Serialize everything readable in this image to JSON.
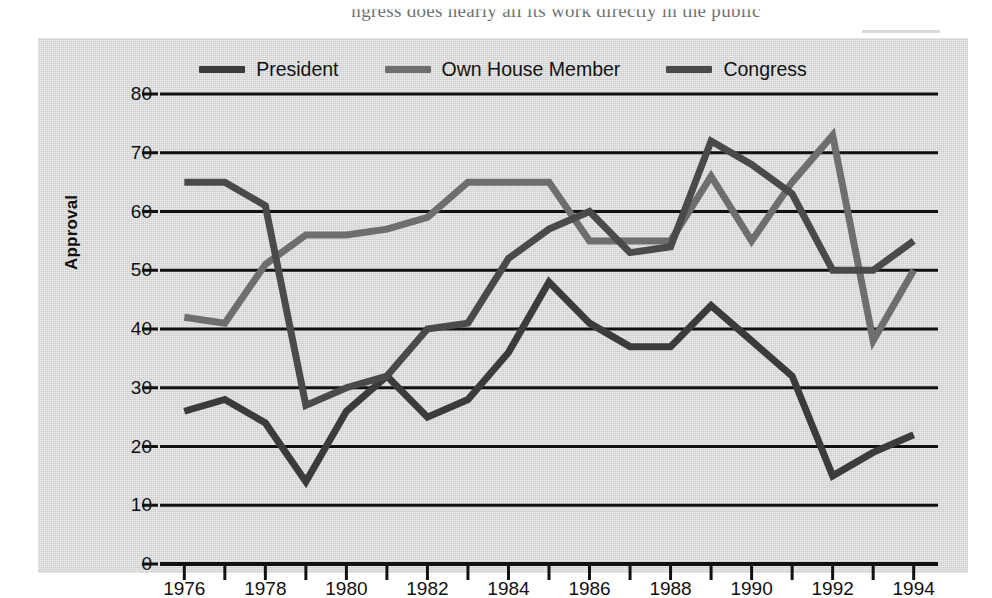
{
  "page": {
    "book_text": "ngress does nearly all its work directly in the public"
  },
  "legend": {
    "items": [
      {
        "label": "President",
        "color": "#3b3b3b"
      },
      {
        "label": "Own House Member",
        "color": "#6e6e6e"
      },
      {
        "label": "Congress",
        "color": "#4a4a4a"
      }
    ]
  },
  "axes": {
    "ylabel": "Approval",
    "yticks": [
      0,
      10,
      20,
      30,
      40,
      50,
      60,
      70,
      80
    ],
    "xticks_labeled": [
      1976,
      1978,
      1980,
      1982,
      1984,
      1986,
      1988,
      1990,
      1992,
      1994
    ],
    "xticks_all": [
      1976,
      1977,
      1978,
      1979,
      1980,
      1981,
      1982,
      1983,
      1984,
      1985,
      1986,
      1987,
      1988,
      1989,
      1990,
      1991,
      1992,
      1993,
      1994
    ]
  },
  "chart_data": {
    "type": "line",
    "title": "",
    "xlabel": "",
    "ylabel": "Approval",
    "xlim": [
      1975.4,
      1994.6
    ],
    "ylim": [
      0,
      80
    ],
    "grid": "horizontal",
    "legend_position": "top-center",
    "x": [
      1976,
      1977,
      1978,
      1979,
      1980,
      1981,
      1982,
      1983,
      1984,
      1985,
      1986,
      1987,
      1988,
      1989,
      1990,
      1991,
      1992,
      1993,
      1994
    ],
    "series": [
      {
        "name": "President",
        "color": "#3b3b3b",
        "values": [
          26,
          28,
          24,
          14,
          26,
          32,
          25,
          28,
          36,
          48,
          41,
          37,
          37,
          44,
          38,
          32,
          15,
          19,
          22
        ]
      },
      {
        "name": "Own House Member",
        "color": "#6e6e6e",
        "values": [
          42,
          41,
          51,
          56,
          56,
          57,
          59,
          65,
          65,
          65,
          55,
          55,
          55,
          66,
          55,
          65,
          73,
          38,
          50
        ]
      },
      {
        "name": "Congress",
        "color": "#4a4a4a",
        "values": [
          65,
          65,
          61,
          27,
          30,
          32,
          40,
          41,
          52,
          57,
          60,
          53,
          54,
          72,
          68,
          63,
          50,
          50,
          55
        ]
      }
    ]
  }
}
